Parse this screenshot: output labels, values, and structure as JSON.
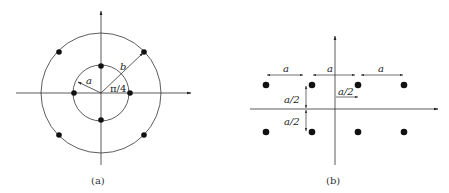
{
  "figure_a": {
    "caption": "(a)",
    "labels": {
      "inner_radius": "a",
      "outer_radius": "b",
      "angle": "π/4"
    },
    "inner_points": 4,
    "outer_points": 4,
    "description": "Two concentric rings: 4 points on inner circle radius a on axes, 4 points on outer circle radius b rotated by π/4"
  },
  "figure_b": {
    "caption": "(b)",
    "labels": {
      "spacing_left": "a",
      "spacing_center": "a",
      "spacing_right": "a",
      "half_horizontal": "a/2",
      "half_vertical_top": "a/2",
      "half_vertical_bottom": "a/2"
    },
    "rows": 2,
    "cols": 4,
    "description": "Rectangular 8-point constellation, 2 rows x 4 columns, spacing a"
  },
  "colors": {
    "line": "#333333",
    "dot": "#111111",
    "background": "#ffffff"
  }
}
